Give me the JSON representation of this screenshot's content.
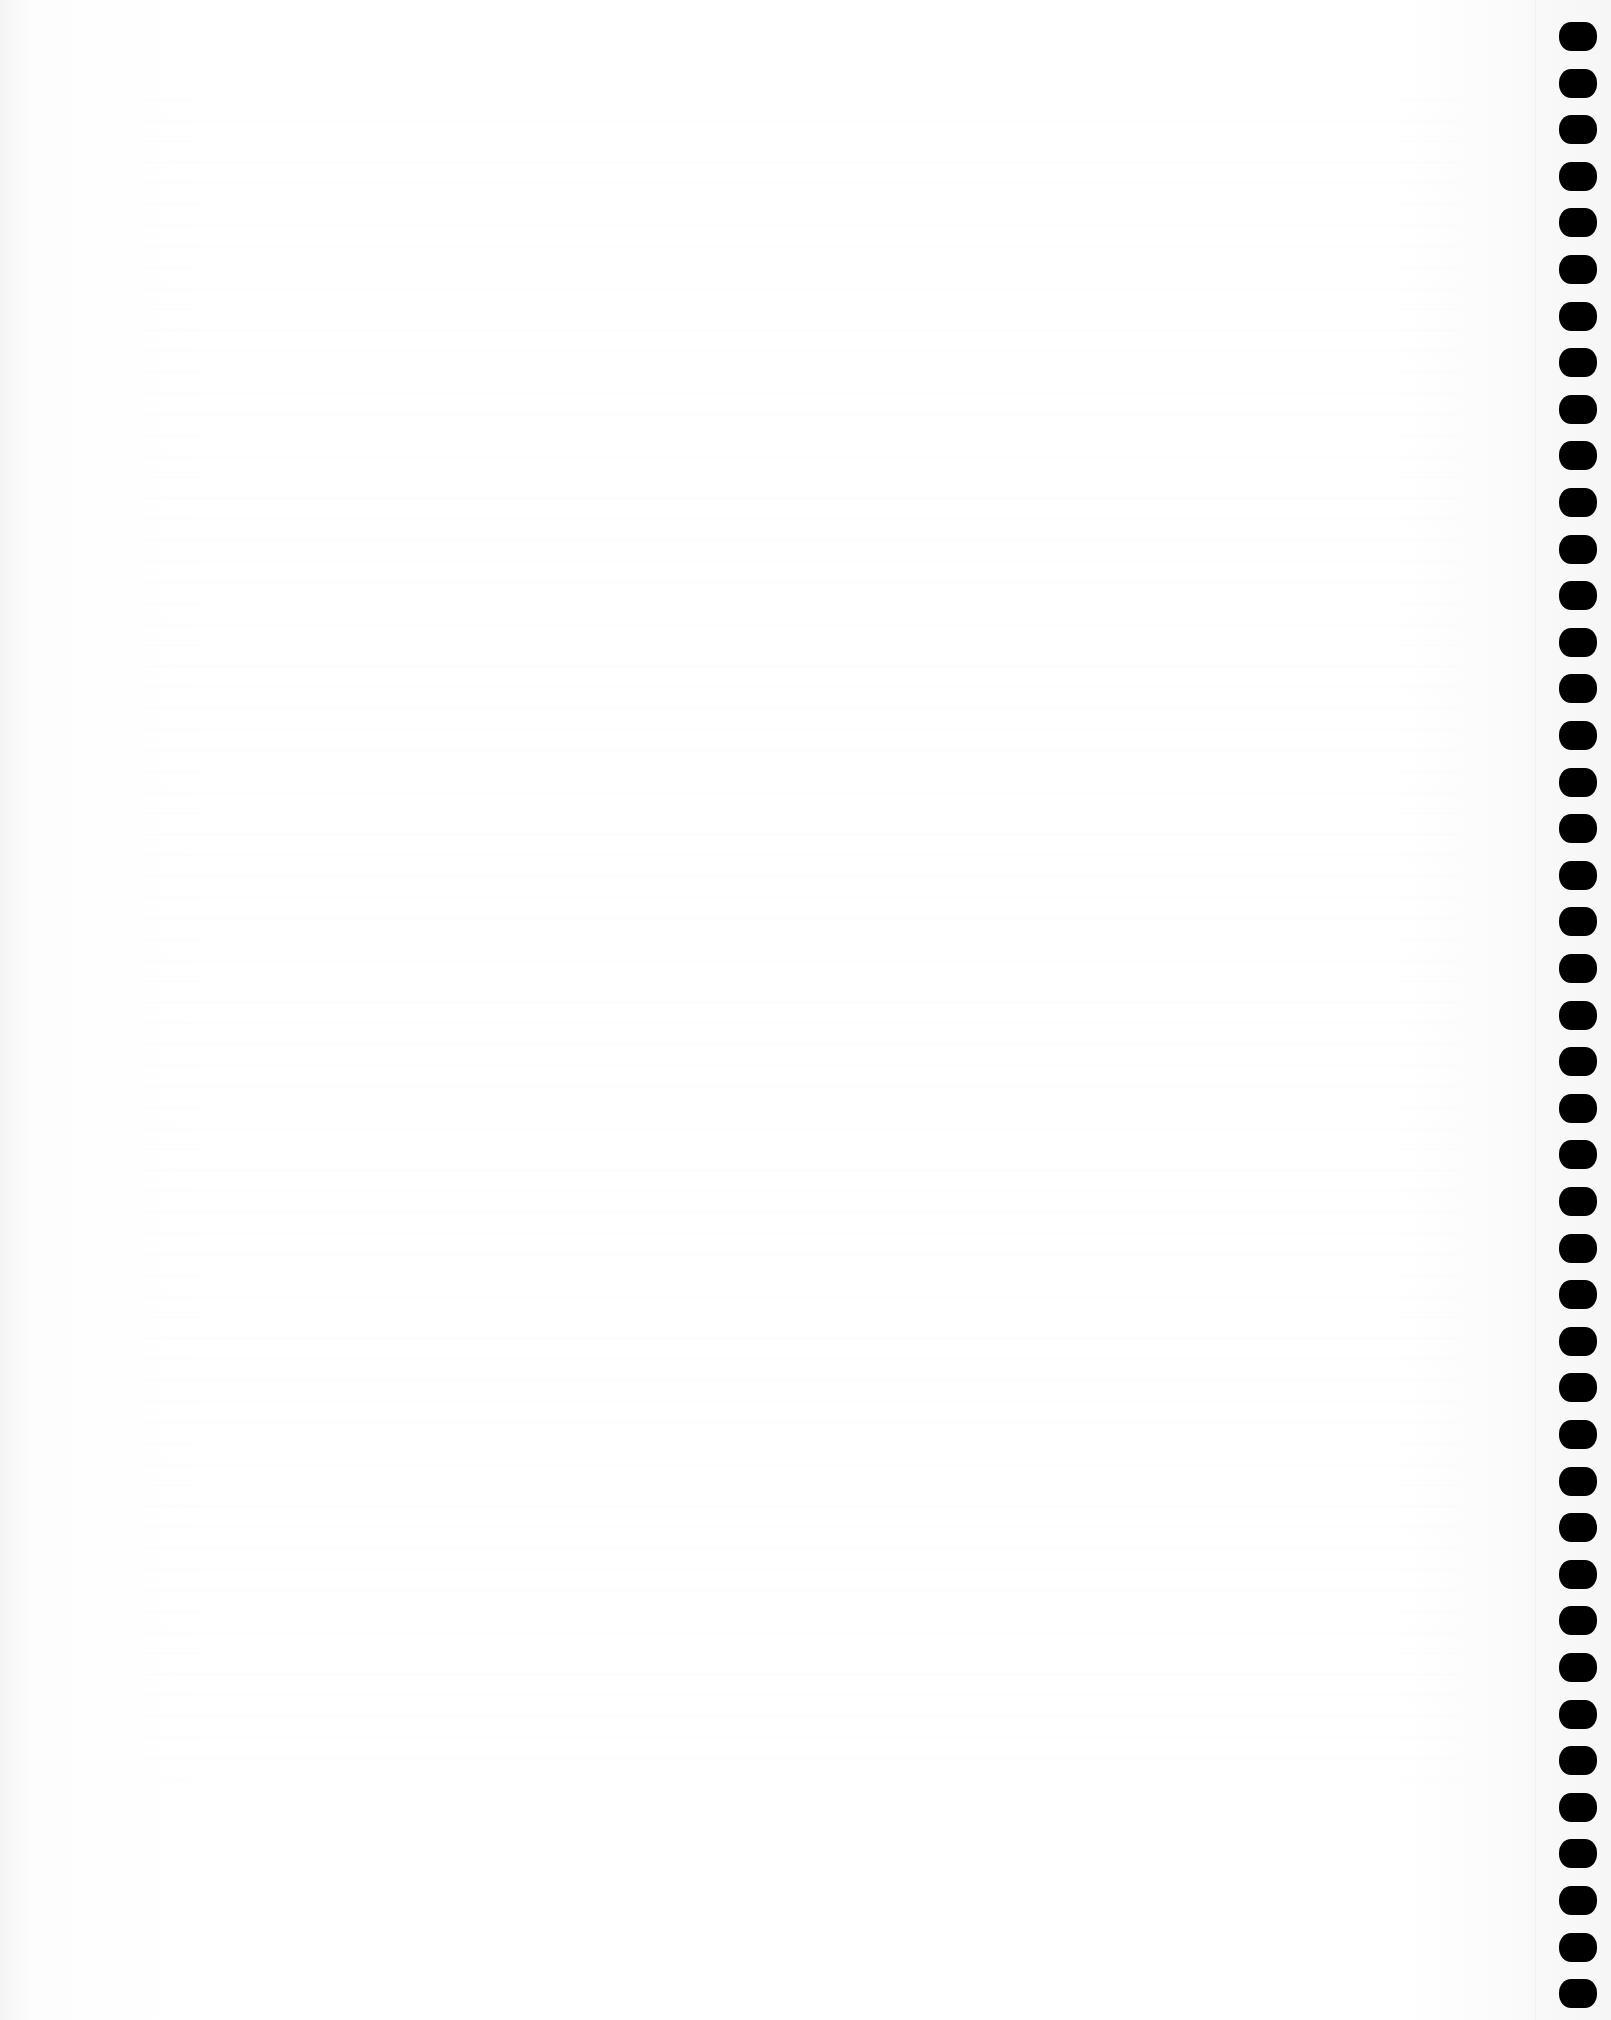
{
  "document": {
    "type": "blank spiral notebook page (back-side show-through only, no legible text)",
    "binding": {
      "side": "right",
      "hole_count": 43,
      "hole_color": "#000000",
      "paper_color": "#fbfbfb"
    }
  }
}
